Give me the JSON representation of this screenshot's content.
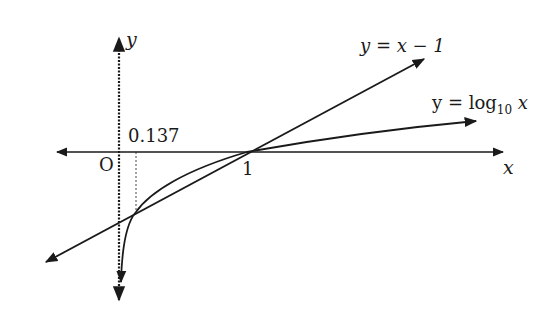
{
  "diagram": {
    "axes": {
      "x_label": "x",
      "y_label": "y",
      "origin_label": "O",
      "tick_labels": [
        "1"
      ]
    },
    "curves": [
      {
        "name": "line",
        "label_prefix": "y = x − 1",
        "equation": "y = x − 1"
      },
      {
        "name": "log",
        "label_prefix": "y = log",
        "label_sub": "10",
        "label_suffix": " x",
        "equation": "y = log10 x"
      }
    ],
    "annotations": {
      "intersection_x_label": "0.137",
      "intersections": [
        {
          "x": 0.137,
          "y": -0.863
        },
        {
          "x": 1,
          "y": 0
        }
      ]
    },
    "colors": {
      "stroke": "#1a1a1a",
      "background": "#ffffff"
    }
  }
}
